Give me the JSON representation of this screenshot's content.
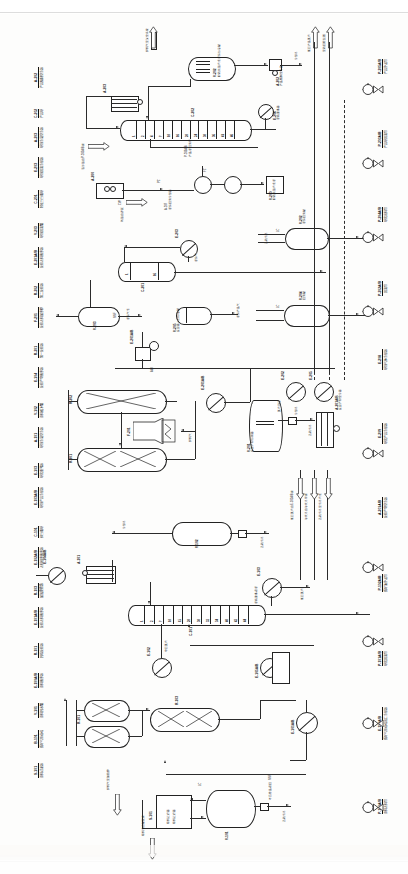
{
  "document": {
    "kind": "process-flow-diagram",
    "orientation": "landscape-sheet-rotated-90",
    "language": "zh-CN",
    "line_color": "#232323",
    "background": "#fdfdfc"
  },
  "legend_column": [
    {
      "tag": "A-202",
      "desc": "产品精制空冷器"
    },
    {
      "tag": "C-202",
      "desc": "产品塔"
    },
    {
      "tag": "A-203",
      "desc": "塔顶冷凝空冷器"
    },
    {
      "tag": "E-203",
      "desc": "塔顶回流冷却器"
    },
    {
      "tag": "C-201",
      "desc": "轻组分分馏塔"
    },
    {
      "tag": "V-203",
      "desc": "塔顶回流罐"
    },
    {
      "tag": "E-201A/B",
      "desc": "反应进料换热器"
    },
    {
      "tag": "R-202",
      "desc": "第二反应器"
    },
    {
      "tag": "F-201",
      "desc": "反应进料加热炉"
    },
    {
      "tag": "R-201",
      "desc": "第一反应器"
    },
    {
      "tag": "E-104",
      "desc": "反应产物换热器"
    },
    {
      "tag": "V-102",
      "desc": "原料缓冲罐"
    },
    {
      "tag": "A-101",
      "desc": "塔顶冷凝空冷器"
    },
    {
      "tag": "E-103",
      "desc": "塔底重沸器"
    },
    {
      "tag": "E-103A/B",
      "desc": "塔顶产品冷却器"
    },
    {
      "tag": "C-101",
      "desc": "预分馏塔"
    },
    {
      "tag": "E-102A/B",
      "desc": "进料预热换热器"
    },
    {
      "tag": "R-103",
      "desc": "加氢反应器"
    },
    {
      "tag": "E-101A/B",
      "desc": "反应进料换热器"
    },
    {
      "tag": "R-101",
      "desc": "脱硫反应器"
    },
    {
      "tag": "E-100A/B",
      "desc": "原料换热器"
    },
    {
      "tag": "V-101",
      "desc": "原料脱水罐"
    },
    {
      "tag": "B-101",
      "desc": "循环气压缩机"
    },
    {
      "tag": "S-101",
      "desc": "原料过滤器"
    }
  ],
  "right_column": [
    {
      "tag": "P-205A/B",
      "desc": "产品外送泵"
    },
    {
      "tag": "P-203A/B",
      "desc": "产品塔回流泵"
    },
    {
      "tag": "P-204A/B",
      "desc": "塔底出料泵"
    },
    {
      "tag": "P-202A/B",
      "desc": "回流泵"
    },
    {
      "tag": "E-208",
      "desc": "塔顶气体冷却器"
    },
    {
      "tag": "E-209",
      "desc": "塔底产品冷却器"
    },
    {
      "tag": "A-201A/B",
      "desc": "反应产物空冷器"
    },
    {
      "tag": "P-102A/B",
      "desc": "循环油外送泵"
    },
    {
      "tag": "P-101A/B",
      "desc": "塔底回流泵"
    },
    {
      "tag": "E-101A/B",
      "desc": "循环气压缩机出口冷却器"
    },
    {
      "tag": "P-100A/B",
      "desc": "原料进料泵"
    }
  ],
  "stream_flags": [
    {
      "id": "f1",
      "label": "燃料气至放空系统"
    },
    {
      "id": "f2",
      "label": "低压产品蒸汽"
    },
    {
      "id": "f3",
      "label": "至硫回收装置"
    },
    {
      "id": "f4",
      "label": "新氢自界区"
    },
    {
      "id": "f5",
      "label": "循环氢自P-205A/B来"
    },
    {
      "id": "f6",
      "label": "低压蒸汽凝液"
    },
    {
      "id": "f7",
      "label": "净化风"
    },
    {
      "id": "f8",
      "label": "含硫污水至污水汽提"
    },
    {
      "id": "f9",
      "label": "粗柴油自罐区来"
    },
    {
      "id": "f10",
      "label": "新氢自P-101A/B来"
    },
    {
      "id": "f11",
      "label": "脱硫化氢干气出装置"
    },
    {
      "id": "f12",
      "label": "循环氢至压缩机入口"
    },
    {
      "id": "f13",
      "label": "轻石脑油出装置"
    },
    {
      "id": "f14",
      "label": "重石脑油出装置"
    },
    {
      "id": "f15",
      "label": "柴油产品出装置"
    },
    {
      "id": "f16",
      "label": "原料油自罐区来"
    },
    {
      "id": "f17",
      "label": "燃料气至加热炉"
    },
    {
      "id": "f18",
      "label": "含硫污水"
    },
    {
      "id": "f19",
      "label": "低压蒸汽"
    },
    {
      "id": "f20",
      "label": "除氧水"
    }
  ],
  "columns": [
    {
      "id": "C-202",
      "tag": "C-202",
      "trays": [
        "1",
        "2",
        "4",
        "7",
        "10",
        "16",
        "20",
        "24",
        "30",
        "36",
        "41",
        "46"
      ]
    },
    {
      "id": "C-201",
      "tag": "C-201",
      "trays": [
        "1",
        "16"
      ]
    },
    {
      "id": "C-101",
      "tag": "C-101",
      "trays": [
        "1",
        "2",
        "7",
        "10",
        "15",
        "20",
        "30",
        "32",
        "34",
        "40",
        "42",
        "44"
      ]
    }
  ],
  "vessels": [
    {
      "tag": "V-202",
      "desc": "脱硫化氢汽提塔顶分液罐"
    },
    {
      "tag": "V-203",
      "desc": "塔顶回流罐"
    },
    {
      "tag": "V-204",
      "desc": "回流罐"
    },
    {
      "tag": "V-201",
      "desc": "反应产物分离器"
    },
    {
      "tag": "V-102",
      "desc": "原料缓冲罐"
    },
    {
      "tag": "V-101",
      "desc": "原料脱水罐"
    }
  ],
  "equipment_inline": [
    {
      "tag": "A-202",
      "desc": "产品精制空冷器"
    },
    {
      "tag": "A-203",
      "desc": "塔顶冷凝空冷器"
    },
    {
      "tag": "A-201",
      "desc": "反应产物空冷器"
    },
    {
      "tag": "A-101",
      "desc": "塔顶冷凝空冷器"
    },
    {
      "tag": "E-206",
      "desc": "塔底重沸器"
    },
    {
      "tag": "E-207",
      "desc": "塔顶回流冷却器"
    },
    {
      "tag": "E-203",
      "desc": "回流冷却器"
    },
    {
      "tag": "E-205",
      "desc": "塔底产品冷却器"
    },
    {
      "tag": "E-204",
      "desc": "中间换热器"
    },
    {
      "tag": "E-201A/B",
      "desc": "反应进料换热器"
    },
    {
      "tag": "E-202",
      "desc": "汽提塔重沸器"
    },
    {
      "tag": "E-208",
      "desc": "循环水冷却器"
    },
    {
      "tag": "F-201",
      "desc": "反应进料加热炉"
    },
    {
      "tag": "R-202",
      "desc": "第二反应器"
    },
    {
      "tag": "R-201",
      "desc": "第一反应器"
    },
    {
      "tag": "R-103",
      "desc": "加氢反应器"
    },
    {
      "tag": "R-101",
      "desc": "脱硫反应器"
    },
    {
      "tag": "E-104",
      "desc": "反应产物换热器"
    },
    {
      "tag": "E-103",
      "desc": "塔底重沸器"
    },
    {
      "tag": "E-102A/B",
      "desc": "进料预热器"
    },
    {
      "tag": "E-101A/B",
      "desc": "反应进料换热器"
    },
    {
      "tag": "E-100A/B",
      "desc": "原料换热器"
    },
    {
      "tag": "B-101",
      "desc": "循环气压缩机"
    },
    {
      "tag": "S-101",
      "desc": "原料过滤器"
    },
    {
      "tag": "V-101",
      "desc": "原料脱水罐"
    }
  ],
  "pumps": [
    {
      "tag": "P-205A/B",
      "desc": "产品外送泵"
    },
    {
      "tag": "P-203A/B",
      "desc": "产品塔回流泵"
    },
    {
      "tag": "P-204A/B",
      "desc": "塔底出料泵"
    },
    {
      "tag": "P-202A/B",
      "desc": "回流泵"
    },
    {
      "tag": "P-201A/B",
      "desc": "反应进料泵"
    },
    {
      "tag": "P-102A/B",
      "desc": "循环油外送泵"
    },
    {
      "tag": "P-101A/B",
      "desc": "塔底回流泵"
    },
    {
      "tag": "P-100A/B",
      "desc": "原料进料泵"
    }
  ],
  "annotations": [
    {
      "label": "循环水"
    },
    {
      "label": "冷却水"
    },
    {
      "label": "低压蒸汽"
    },
    {
      "label": "蒸汽凝液"
    },
    {
      "label": "净化风"
    },
    {
      "label": "燃料气"
    },
    {
      "label": "含硫污水"
    },
    {
      "label": "除氧水"
    },
    {
      "label": "至火炬"
    },
    {
      "label": "新氢"
    },
    {
      "label": "循环氢"
    },
    {
      "label": "LC"
    },
    {
      "label": "FC"
    },
    {
      "label": "TC"
    },
    {
      "label": "PC"
    },
    {
      "label": "PDI"
    },
    {
      "label": "AI"
    },
    {
      "label": "CWS"
    },
    {
      "label": "CWR"
    }
  ]
}
